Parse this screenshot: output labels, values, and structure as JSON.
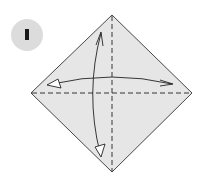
{
  "diagram": {
    "type": "origami-step",
    "step": {
      "number": "1"
    },
    "paper": {
      "shape": "square-rotated-45",
      "fill": "#e6e6e6",
      "stroke": "#333333",
      "vertices": {
        "top": [
          112,
          15
        ],
        "right": [
          192,
          93
        ],
        "bottom": [
          112,
          172
        ],
        "left": [
          31,
          93
        ]
      }
    },
    "creases": [
      {
        "name": "vertical-valley-fold",
        "style": "dashed",
        "from": [
          112,
          15
        ],
        "to": [
          112,
          172
        ]
      },
      {
        "name": "horizontal-valley-fold",
        "style": "dashed",
        "from": [
          31,
          93
        ],
        "to": [
          192,
          93
        ]
      }
    ],
    "arrows": [
      {
        "name": "fold-and-unfold-horizontal",
        "style": "curved-double-headed",
        "ends": [
          "left-open-triangle",
          "right-open-hook"
        ]
      },
      {
        "name": "fold-and-unfold-vertical",
        "style": "curved-double-headed",
        "ends": [
          "top-hook",
          "bottom-open-triangle"
        ]
      }
    ]
  }
}
